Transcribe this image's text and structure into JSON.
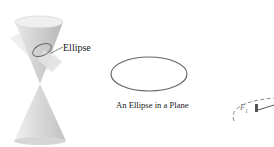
{
  "figure": {
    "panels": [
      {
        "id": "double-cone",
        "label": "Ellipse",
        "description": "Double-napped cone intersected by a tilted plane"
      },
      {
        "id": "plane-ellipse",
        "caption": "An Ellipse in a Plane"
      },
      {
        "id": "foci-ellipse",
        "focus_label": "F",
        "focus_subscript": "1"
      }
    ],
    "colors": {
      "cone_fill": "#d9d9d9",
      "cone_shade": "#bdbdbd",
      "plane_fill": "#e6e6e6",
      "ellipse_stroke": "#555555",
      "dashed_stroke": "#888888",
      "text": "#1a1a1a"
    }
  }
}
